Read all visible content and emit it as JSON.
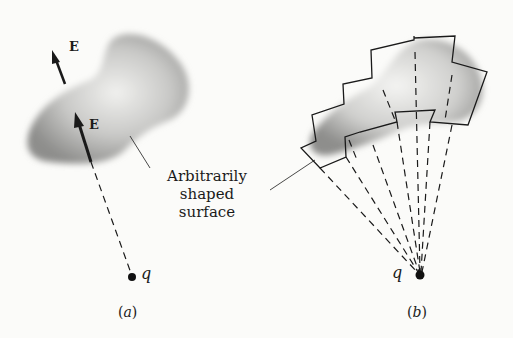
{
  "panel_a": {
    "field_label_outer": "E",
    "field_label_inner": "E",
    "charge_label": "q",
    "caption_open": "(",
    "caption_letter": "a",
    "caption_close": ")"
  },
  "panel_b": {
    "charge_label": "q",
    "caption_open": "(",
    "caption_letter": "b",
    "caption_close": ")"
  },
  "annotation": {
    "line1": "Arbitrarily",
    "line2": "shaped",
    "line3": "surface"
  },
  "colors": {
    "background": "#fbfbf9",
    "ink": "#1a1a1a",
    "surface_shade": "#8a8a8a"
  }
}
